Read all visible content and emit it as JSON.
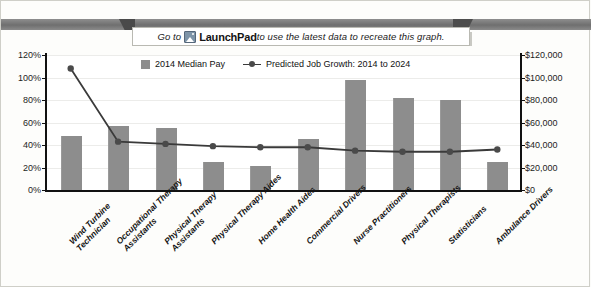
{
  "banner": {
    "prefix": "Go to ",
    "icon": "launchpad-image-icon",
    "brand": "LaunchPad",
    "suffix": " to use the latest data to recreate this graph."
  },
  "legend": [
    {
      "label": "2014 Median Pay",
      "marker": "square",
      "color": "#8d8d8d"
    },
    {
      "label": "Predicted Job Growth: 2014 to 2024",
      "marker": "line-diamond",
      "color": "#3a3a3a"
    }
  ],
  "axis": {
    "left_ticks": [
      "120%",
      "100%",
      "80%",
      "60%",
      "40%",
      "20%",
      "0%"
    ],
    "right_ticks": [
      "$120,000",
      "$100,000",
      "$80,000",
      "$60,000",
      "$40,000",
      "$20,000",
      "$0"
    ]
  },
  "chart_data": {
    "type": "bar",
    "title": "",
    "xlabel": "",
    "ylabel": "",
    "grid": true,
    "legend_position": "top-center",
    "categories": [
      "Wind Turbine Technician",
      "Occupational Therapy Assistants",
      "Physical Therapy Assistants",
      "Physical Therapy Aides",
      "Home Health Aides",
      "Commercial Drivers",
      "Nurse Practitioners",
      "Physical Therapists",
      "Statisticians",
      "Ambulance Drivers"
    ],
    "category_lines": [
      [
        "Wind Turbine",
        "Technician"
      ],
      [
        "Occupational Therapy",
        "Assistants"
      ],
      [
        "Physical Therapy",
        "Assistants"
      ],
      [
        "Physical Therapy Aides"
      ],
      [
        "Home Health Aides"
      ],
      [
        "Commercial Drivers"
      ],
      [
        "Nurse Practitioners"
      ],
      [
        "Physical Therapists"
      ],
      [
        "Statisticians"
      ],
      [
        "Ambulance Drivers"
      ]
    ],
    "series": [
      {
        "name": "2014 Median Pay",
        "type": "bar",
        "axis": "right",
        "unit": "USD",
        "ylim": [
          0,
          120000
        ],
        "values": [
          48000,
          57000,
          55000,
          25000,
          21000,
          45000,
          98000,
          82000,
          80000,
          25000
        ]
      },
      {
        "name": "Predicted Job Growth: 2014 to 2024",
        "type": "line",
        "axis": "left",
        "unit": "percent",
        "ylim": [
          0,
          120
        ],
        "values": [
          108,
          43,
          41,
          39,
          38,
          38,
          35,
          34,
          34,
          36
        ]
      }
    ]
  }
}
